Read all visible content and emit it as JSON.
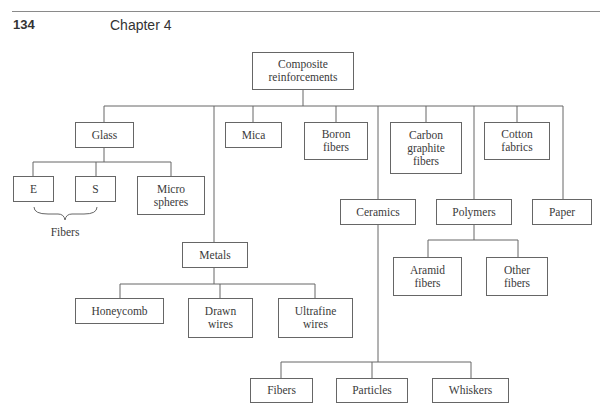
{
  "header": {
    "page_number": "134",
    "chapter_title": "Chapter 4"
  },
  "diagram": {
    "root": "Composite\nreinforcements",
    "level1": {
      "glass": "Glass",
      "mica": "Mica",
      "boron": "Boron\nfibers",
      "carbon": "Carbon\ngraphite\nfibers",
      "cotton": "Cotton\nfabrics",
      "metals": "Metals",
      "ceramics": "Ceramics",
      "polymers": "Polymers",
      "paper": "Paper"
    },
    "glass_children": {
      "e": "E",
      "s": "S",
      "micro": "Micro\nspheres",
      "brace_label": "Fibers"
    },
    "metals_children": {
      "honeycomb": "Honeycomb",
      "drawn": "Drawn\nwires",
      "ultrafine": "Ultrafine\nwires"
    },
    "polymers_children": {
      "aramid": "Aramid\nfibers",
      "other": "Other\nfibers"
    },
    "ceramics_children": {
      "fibers": "Fibers",
      "particles": "Particles",
      "whiskers": "Whiskers"
    }
  }
}
